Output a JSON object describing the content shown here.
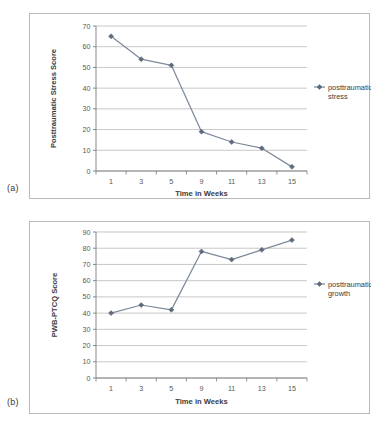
{
  "figure": {
    "panel_a_tag": "(a)",
    "panel_b_tag": "(b)",
    "line_color": "#7d8a9b",
    "marker_color": "#5f6b7a",
    "gridline_color": "#b0b0b0",
    "axis_color": "#7a7a7a",
    "text_color": "#3b3b3b"
  },
  "chart_data": [
    {
      "type": "line",
      "panel": "(a)",
      "title": "",
      "xlabel": "Time in Weeks",
      "ylabel": "Posttraumatic Stress Score",
      "categories": [
        "1",
        "3",
        "5",
        "9",
        "11",
        "13",
        "15"
      ],
      "x": [
        1,
        3,
        5,
        9,
        11,
        13,
        15
      ],
      "series": [
        {
          "name": "posttraumatic stress",
          "values": [
            65,
            54,
            51,
            19,
            14,
            11,
            2
          ]
        }
      ],
      "ylim": [
        0,
        70
      ],
      "yticks": [
        "0",
        "10",
        "20",
        "30",
        "40",
        "50",
        "60",
        "70"
      ],
      "xticks": [
        "1",
        "3",
        "5",
        "9",
        "11",
        "13",
        "15"
      ],
      "grid": true,
      "legend_position": "right",
      "legend": [
        "posttraumatic stress"
      ],
      "legend_line1": "posttraumatic",
      "legend_line2": "stress"
    },
    {
      "type": "line",
      "panel": "(b)",
      "title": "",
      "xlabel": "Time in Weeks",
      "ylabel": "PWB-PTCQ Score",
      "categories": [
        "1",
        "3",
        "5",
        "9",
        "11",
        "13",
        "15"
      ],
      "x": [
        1,
        3,
        5,
        9,
        11,
        13,
        15
      ],
      "series": [
        {
          "name": "posttraumatic growth",
          "values": [
            40,
            45,
            42,
            78,
            73,
            79,
            85
          ]
        }
      ],
      "ylim": [
        0,
        90
      ],
      "yticks": [
        "0",
        "10",
        "20",
        "30",
        "40",
        "50",
        "60",
        "70",
        "80",
        "90"
      ],
      "xticks": [
        "1",
        "3",
        "5",
        "9",
        "11",
        "13",
        "15"
      ],
      "grid": true,
      "legend_position": "right",
      "legend": [
        "posttraumatic growth"
      ],
      "legend_line1": "posttraumatic",
      "legend_line2": "growth"
    }
  ]
}
